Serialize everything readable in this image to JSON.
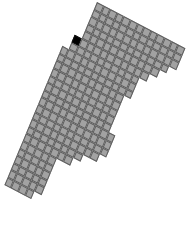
{
  "board": {
    "tile_size": 7.6,
    "origin": [
      97,
      2
    ],
    "matrix": [
      0.893,
      0.467,
      -0.4,
      0.96
    ],
    "colors": {
      "tile": "#a2a2a2",
      "grid_line": "#5e5e5e",
      "marked_tile": "#000000",
      "background": "#ffffff"
    },
    "rows": [
      [
        0,
        12
      ],
      [
        0,
        12
      ],
      [
        0,
        12
      ],
      [
        0,
        11
      ],
      [
        0,
        10
      ],
      [
        -1,
        9
      ],
      [
        -1,
        8
      ],
      [
        -2,
        8
      ],
      [
        -2,
        8
      ],
      [
        -2,
        7
      ],
      [
        -2,
        7
      ],
      [
        -2,
        7
      ],
      [
        -2,
        7
      ],
      [
        -2,
        7
      ],
      [
        -2,
        8
      ],
      [
        -2,
        8
      ],
      [
        -2,
        8
      ],
      [
        -2,
        7
      ],
      [
        -2,
        5
      ],
      [
        -2,
        4
      ],
      [
        -2,
        2
      ],
      [
        -2,
        2
      ],
      [
        -2,
        2
      ],
      [
        -2,
        2
      ],
      [
        -2,
        2
      ],
      [
        -2,
        1
      ]
    ],
    "marked": [
      [
        5,
        -1
      ]
    ]
  }
}
